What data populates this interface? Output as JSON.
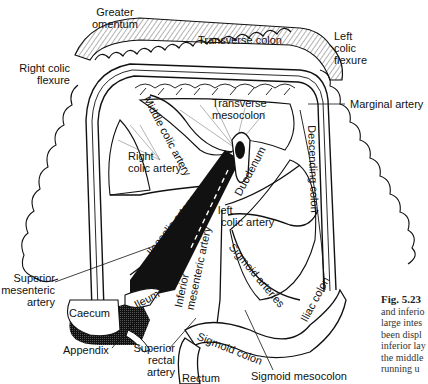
{
  "figure": {
    "number": "Fig. 5.23",
    "caption_lines": [
      "and inferio",
      "large intes",
      "been displ",
      "inferior lay",
      "the middle",
      "running u"
    ]
  },
  "labels": {
    "greater_omentum": [
      "Greater",
      "omentum"
    ],
    "transverse_colon": "Transverse colon",
    "left_colic_flexure": [
      "Left",
      "colic",
      "flexure"
    ],
    "right_colic_flexure": [
      "Right colic",
      "flexure"
    ],
    "transverse_mesocolon": [
      "Transverse",
      "mesocolon"
    ],
    "marginal_artery": "Marginal artery",
    "middle_colic_artery": "Middle colic artery",
    "descending_colon": "Descending colon",
    "right_colic_artery": [
      "Right",
      "colic artery"
    ],
    "duodenum": "Duodenum",
    "ileocolic_artery": "Ileocolic artery",
    "left_colic_artery": [
      "left",
      "colic  artery"
    ],
    "sigmoid_arteries": "Sigmoid  arteries",
    "inferior_mesenteric_artery": [
      "Inferior",
      "mesenteric artery"
    ],
    "superior_mesenteric_artery": [
      "Superior",
      "mesenteric",
      "artery"
    ],
    "ileum": "Ileum",
    "caecum": "Caecum",
    "appendix": "Appendix",
    "superior_rectal_artery": [
      "Superior",
      "rectal",
      "artery"
    ],
    "iliac_colon": "Iliac colon",
    "sigmoid_colon": "Sigmoid colon",
    "rectum": "Rectum",
    "sigmoid_mesocolon": "Sigmoid mesocolon"
  },
  "colors": {
    "ink": "#111111",
    "background": "#ffffff",
    "caption": "#333333"
  }
}
